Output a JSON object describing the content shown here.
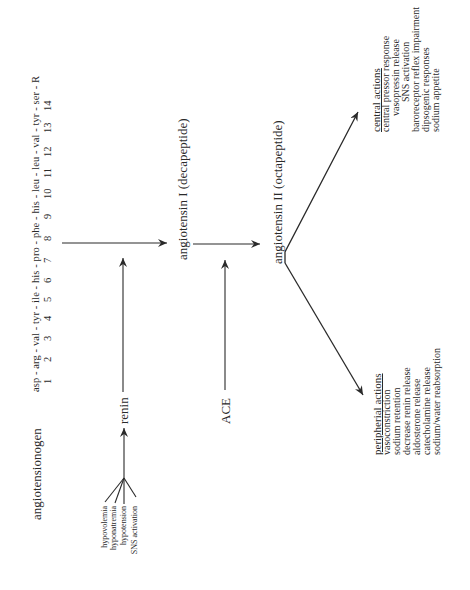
{
  "diagram": {
    "title_node": "angiotensionogen",
    "sequence": {
      "residues": "asp - arg - val - tyr - ile - his - pro - phe - his - leu - leu - val - tyr - ser - R",
      "positions": [
        "1",
        "2",
        "3",
        "4",
        "5",
        "6",
        "7",
        "8",
        "9",
        "10",
        "11",
        "12",
        "13",
        "14"
      ]
    },
    "stimuli": [
      "hypovolemia",
      "hyponatremia",
      "hypotension",
      "SNS activation"
    ],
    "enzymes": {
      "renin": "renin",
      "ace": "ACE"
    },
    "products": {
      "angiotensin_1": "angiotensin I (decapeptide)",
      "angiotensin_2": "angiotensin II (octapeptide)"
    },
    "central_actions": {
      "heading": "central actions",
      "items": [
        "central pressor response",
        "vasopressin release",
        "SNS activation",
        "baroreceptor reflex impairment",
        "dipsogenic responses",
        "sodium appetite"
      ]
    },
    "peripheral_actions": {
      "heading": "peripherial actions",
      "items": [
        "vasoconstriction",
        "sodium retention",
        "decrease renin release",
        "aldosterone release",
        "catecholamine release",
        "sodium/water reabsorption"
      ]
    },
    "colors": {
      "ink": "#2a2a2a",
      "background": "#ffffff"
    }
  }
}
